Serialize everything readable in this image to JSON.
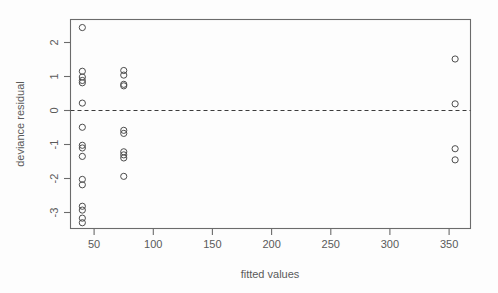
{
  "chart_data": {
    "type": "scatter",
    "title": "",
    "xlabel": "fitted values",
    "ylabel": "deviance residual",
    "xlim": [
      30,
      368
    ],
    "ylim": [
      -3.0,
      2.45
    ],
    "xticks": [
      50,
      100,
      150,
      200,
      250,
      300,
      350
    ],
    "xtick_labels": [
      "50",
      "100",
      "150",
      "200",
      "250",
      "300",
      "350"
    ],
    "yticks": [
      2,
      1,
      0,
      -1,
      -2,
      -3
    ],
    "ytick_labels": [
      "2",
      "1",
      "0",
      "-1",
      "-2",
      "-3"
    ],
    "grid": false,
    "legend": null,
    "marker": "open-circle",
    "annotations": [
      {
        "type": "hline",
        "y": 0,
        "style": "dashed",
        "label": "zero reference line"
      }
    ],
    "points": [
      {
        "x": 40,
        "y": 2.24
      },
      {
        "x": 40,
        "y": 1.1
      },
      {
        "x": 40,
        "y": 0.95
      },
      {
        "x": 40,
        "y": 0.86
      },
      {
        "x": 40,
        "y": 0.8
      },
      {
        "x": 40,
        "y": 0.27
      },
      {
        "x": 40,
        "y": -0.36
      },
      {
        "x": 40,
        "y": -0.83
      },
      {
        "x": 40,
        "y": -0.9
      },
      {
        "x": 40,
        "y": -1.12
      },
      {
        "x": 40,
        "y": -1.72
      },
      {
        "x": 40,
        "y": -1.86
      },
      {
        "x": 40,
        "y": -2.42
      },
      {
        "x": 40,
        "y": -2.52
      },
      {
        "x": 40,
        "y": -2.73
      },
      {
        "x": 40,
        "y": -2.85
      },
      {
        "x": 75,
        "y": 1.12
      },
      {
        "x": 75,
        "y": 1.0
      },
      {
        "x": 75,
        "y": 0.76
      },
      {
        "x": 75,
        "y": 0.72
      },
      {
        "x": 75,
        "y": -0.44
      },
      {
        "x": 75,
        "y": -0.52
      },
      {
        "x": 75,
        "y": -1.0
      },
      {
        "x": 75,
        "y": -1.08
      },
      {
        "x": 75,
        "y": -1.16
      },
      {
        "x": 75,
        "y": -1.64
      },
      {
        "x": 355,
        "y": 1.42
      },
      {
        "x": 355,
        "y": 0.25
      },
      {
        "x": 355,
        "y": -0.92
      },
      {
        "x": 355,
        "y": -1.21
      }
    ]
  },
  "colors": {
    "marker_stroke": "#4d4d4d",
    "frame": "#6b6b6b",
    "zero_line": "#3c3c3c",
    "text": "#5a5a5a",
    "background": "#fdfdfd"
  }
}
